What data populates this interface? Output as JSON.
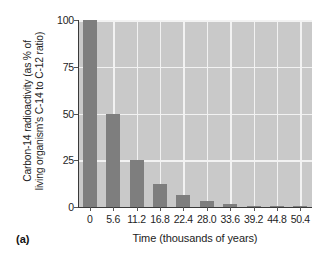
{
  "figure": {
    "panel_label": "(a)",
    "colors": {
      "plot_background": "#c9c9c9",
      "bar": "#7e7e7e",
      "gridline": "#f2f2f2",
      "axis": "#3a3a3a",
      "text": "#1e1e1e",
      "page_background": "#ffffff"
    }
  },
  "chart_data": {
    "type": "bar",
    "title": "",
    "xlabel": "Time (thousands of years)",
    "ylabel_line1": "Carbon-14 radioactivity (as % of",
    "ylabel_line2": "living organism's C-14 to C-12 ratio)",
    "ylabel": "Carbon-14 radioactivity (as % of living organism's C-14 to C-12 ratio)",
    "categories": [
      "0",
      "5.6",
      "11.2",
      "16.8",
      "22.4",
      "28.0",
      "33.6",
      "39.2",
      "44.8",
      "50.4"
    ],
    "x": [
      0,
      5.6,
      11.2,
      16.8,
      22.4,
      28.0,
      33.6,
      39.2,
      44.8,
      50.4
    ],
    "values": [
      100,
      50,
      25,
      12.5,
      6.25,
      3.13,
      1.56,
      0.78,
      0.39,
      0.2
    ],
    "ylim": [
      0,
      100
    ],
    "xlim": [
      0,
      50.4
    ],
    "yticks": [
      0,
      25,
      50,
      75,
      100
    ],
    "ytick_labels": [
      "0",
      "25",
      "50",
      "75",
      "100"
    ],
    "xtick_labels": [
      "0",
      "5.6",
      "11.2",
      "16.8",
      "22.4",
      "28.0",
      "33.6",
      "39.2",
      "44.8",
      "50.4"
    ],
    "grid": true,
    "grid_axis": "both",
    "legend": false,
    "legend_position": "none",
    "annotations": [
      "(a)"
    ]
  }
}
